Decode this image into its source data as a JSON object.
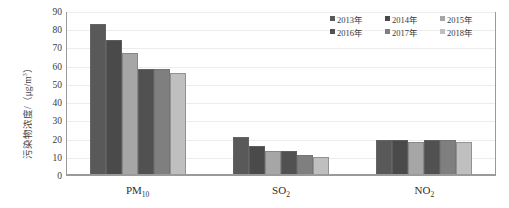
{
  "chart_data": {
    "type": "bar",
    "title": "",
    "subtitle": "",
    "xlabel": "",
    "ylabel": "污染物浓度/（μg/m³）",
    "ylabel_main": "污染物浓度/（μg/m",
    "ylabel_sup": "3",
    "ylabel_tail": "）",
    "categories": [
      "PM10",
      "SO2",
      "NO2"
    ],
    "category_labels": [
      {
        "base": "PM",
        "sub": "10"
      },
      {
        "base": "SO",
        "sub": "2"
      },
      {
        "base": "NO",
        "sub": "2"
      }
    ],
    "ylim": [
      0,
      90
    ],
    "yticks": [
      0,
      10,
      20,
      30,
      40,
      50,
      60,
      70,
      80,
      90
    ],
    "ytick_labels": [
      "0",
      "10",
      "20",
      "30",
      "40",
      "50",
      "60",
      "70",
      "80",
      "90"
    ],
    "grid": true,
    "grid_axis": "y",
    "legend_position": "top-right",
    "series": [
      {
        "name": "2013年",
        "color": "#595959",
        "values": [
          83,
          21,
          19
        ]
      },
      {
        "name": "2014年",
        "color": "#4a4a4a",
        "values": [
          74,
          16,
          19
        ]
      },
      {
        "name": "2015年",
        "color": "#a6a6a6",
        "values": [
          67,
          13,
          18
        ]
      },
      {
        "name": "2016年",
        "color": "#515151",
        "values": [
          58,
          13,
          19
        ]
      },
      {
        "name": "2017年",
        "color": "#7f7f7f",
        "values": [
          58,
          11,
          19
        ]
      },
      {
        "name": "2018年",
        "color": "#bfbfbf",
        "values": [
          56,
          10,
          18
        ]
      }
    ]
  },
  "legend": {
    "items": [
      {
        "label": "2013年",
        "color": "#595959"
      },
      {
        "label": "2014年",
        "color": "#4a4a4a"
      },
      {
        "label": "2015年",
        "color": "#a6a6a6"
      },
      {
        "label": "2016年",
        "color": "#515151"
      },
      {
        "label": "2017年",
        "color": "#7f7f7f"
      },
      {
        "label": "2018年",
        "color": "#bfbfbf"
      }
    ]
  },
  "axis": {
    "y_title_text": "污染物浓度/（μg/m3）",
    "y_max": 90,
    "y_min": 0,
    "y_step": 10
  }
}
